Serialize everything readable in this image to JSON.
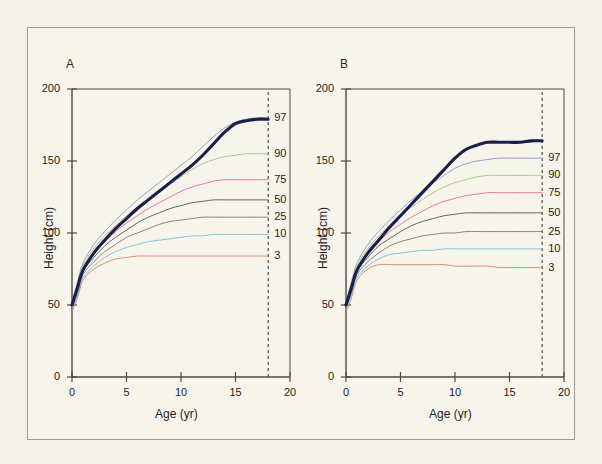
{
  "figure": {
    "background_color": "#f7f5eb",
    "border_color": "#9d9c93",
    "panels": [
      {
        "letter": "A",
        "xlabel": "Age (yr)",
        "ylabel": "Height (cm)"
      },
      {
        "letter": "B",
        "xlabel": "Age (yr)",
        "ylabel": "Height (cm)"
      }
    ]
  },
  "axes": {
    "y_ticks": [
      "0",
      "50",
      "100",
      "150",
      "200"
    ],
    "x_ticks": [
      "0",
      "5",
      "10",
      "15",
      "20"
    ],
    "xlabel": "Age (yr)",
    "ylabel": "Height (cm)"
  },
  "percentile_labels": [
    "97",
    "90",
    "75",
    "50",
    "25",
    "10",
    "3"
  ],
  "colors": {
    "p97": "#8d93c9",
    "p90": "#9fc47f",
    "p75": "#e2718f",
    "p50": "#4f5a44",
    "p25": "#7c7a68",
    "p10": "#6fc0e0",
    "p3": "#d98363",
    "patient": "#1b1f4b",
    "axis": "#4a4a48",
    "dashed": "#5a5a58"
  },
  "chart_data": [
    {
      "type": "line",
      "title": "A",
      "xlabel": "Age (yr)",
      "ylabel": "Height (cm)",
      "xlim": [
        0,
        20
      ],
      "ylim": [
        0,
        200
      ],
      "xticks": [
        0,
        5,
        10,
        15,
        20
      ],
      "yticks": [
        0,
        50,
        100,
        150,
        200
      ],
      "grid": false,
      "legend_position": "right-inline-labels",
      "annotations": [
        {
          "text": "18",
          "type": "vertical-dashed-line",
          "x": 18
        }
      ],
      "x": [
        0,
        0.5,
        1,
        2,
        3,
        4,
        5,
        6,
        7,
        8,
        9,
        10,
        11,
        12,
        13,
        14,
        15,
        16,
        17,
        18
      ],
      "series": [
        {
          "name": "97",
          "color": "#8d93c9",
          "values": [
            52,
            66,
            79,
            92,
            101,
            109,
            116,
            123,
            129,
            135,
            141,
            147,
            153,
            160,
            167,
            173,
            177,
            179,
            180,
            180
          ]
        },
        {
          "name": "90",
          "color": "#9fc47f",
          "values": [
            51,
            64,
            77,
            89,
            98,
            105,
            112,
            118,
            124,
            129,
            134,
            139,
            144,
            148,
            151,
            153,
            154,
            155,
            155,
            155
          ]
        },
        {
          "name": "75",
          "color": "#e2718f",
          "values": [
            50,
            62,
            75,
            86,
            94,
            101,
            107,
            112,
            117,
            121,
            125,
            129,
            132,
            134,
            136,
            137,
            137,
            137,
            137,
            137
          ]
        },
        {
          "name": "50",
          "color": "#4f5a44",
          "values": [
            49,
            60,
            73,
            83,
            91,
            97,
            102,
            107,
            111,
            114,
            117,
            119,
            121,
            122,
            123,
            123,
            123,
            123,
            123,
            123
          ]
        },
        {
          "name": "25",
          "color": "#7c7a68",
          "values": [
            48,
            58,
            71,
            80,
            87,
            92,
            97,
            100,
            103,
            106,
            108,
            109,
            110,
            111,
            111,
            111,
            111,
            111,
            111,
            111
          ]
        },
        {
          "name": "10",
          "color": "#6fc0e0",
          "values": [
            47,
            57,
            69,
            77,
            83,
            87,
            90,
            92,
            94,
            95,
            96,
            97,
            98,
            98,
            99,
            99,
            99,
            99,
            99,
            99
          ]
        },
        {
          "name": "3",
          "color": "#d98363",
          "values": [
            45,
            55,
            67,
            75,
            79,
            82,
            83,
            84,
            84,
            84,
            84,
            84,
            84,
            84,
            84,
            84,
            84,
            84,
            84,
            84
          ]
        },
        {
          "name": "patient",
          "color": "#1b1f4b",
          "thick": true,
          "values": [
            50,
            62,
            74,
            86,
            95,
            103,
            110,
            117,
            123,
            129,
            135,
            141,
            147,
            154,
            162,
            170,
            176,
            178,
            179,
            179
          ]
        }
      ]
    },
    {
      "type": "line",
      "title": "B",
      "xlabel": "Age (yr)",
      "ylabel": "Height (cm)",
      "xlim": [
        0,
        20
      ],
      "ylim": [
        0,
        200
      ],
      "xticks": [
        0,
        5,
        10,
        15,
        20
      ],
      "yticks": [
        0,
        50,
        100,
        150,
        200
      ],
      "grid": false,
      "legend_position": "right-inline-labels",
      "annotations": [
        {
          "text": "18",
          "type": "vertical-dashed-line",
          "x": 18
        }
      ],
      "x": [
        0,
        0.5,
        1,
        2,
        3,
        4,
        5,
        6,
        7,
        8,
        9,
        10,
        11,
        12,
        13,
        14,
        15,
        16,
        17,
        18
      ],
      "series": [
        {
          "name": "97",
          "color": "#8d93c9",
          "values": [
            52,
            66,
            79,
            92,
            101,
            109,
            116,
            123,
            129,
            135,
            140,
            145,
            148,
            150,
            151,
            152,
            152,
            152,
            152,
            152
          ]
        },
        {
          "name": "90",
          "color": "#9fc47f",
          "values": [
            51,
            64,
            77,
            89,
            98,
            105,
            112,
            118,
            123,
            128,
            132,
            135,
            137,
            139,
            140,
            140,
            140,
            140,
            140,
            140
          ]
        },
        {
          "name": "75",
          "color": "#e2718f",
          "values": [
            50,
            62,
            75,
            86,
            94,
            101,
            106,
            111,
            115,
            119,
            122,
            124,
            126,
            127,
            128,
            128,
            128,
            128,
            128,
            128
          ]
        },
        {
          "name": "50",
          "color": "#4f5a44",
          "values": [
            49,
            60,
            73,
            83,
            91,
            96,
            101,
            105,
            108,
            110,
            112,
            113,
            114,
            114,
            114,
            114,
            114,
            114,
            114,
            114
          ]
        },
        {
          "name": "25",
          "color": "#7c7a68",
          "values": [
            48,
            58,
            71,
            80,
            86,
            91,
            94,
            96,
            98,
            99,
            100,
            100,
            101,
            101,
            101,
            101,
            101,
            101,
            101,
            101
          ]
        },
        {
          "name": "10",
          "color": "#6fc0e0",
          "values": [
            47,
            57,
            69,
            77,
            82,
            85,
            86,
            87,
            88,
            88,
            89,
            89,
            89,
            89,
            89,
            89,
            89,
            89,
            89,
            89
          ]
        },
        {
          "name": "3",
          "color": "#d98363",
          "values": [
            45,
            55,
            67,
            75,
            78,
            78,
            78,
            78,
            78,
            78,
            78,
            77,
            77,
            77,
            77,
            76,
            76,
            76,
            76,
            76
          ]
        },
        {
          "name": "patient",
          "color": "#1b1f4b",
          "thick": true,
          "values": [
            50,
            62,
            74,
            86,
            95,
            104,
            112,
            120,
            128,
            136,
            144,
            152,
            158,
            161,
            163,
            163,
            163,
            163,
            164,
            164
          ]
        }
      ]
    }
  ]
}
